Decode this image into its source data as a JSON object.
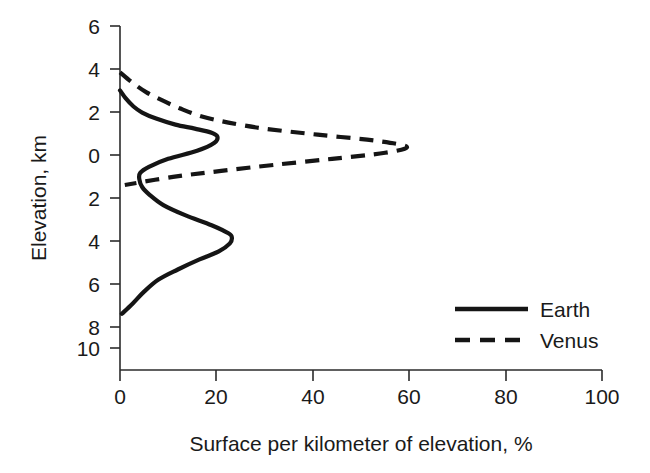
{
  "chart_data": {
    "type": "line",
    "title": "",
    "subtitle": "",
    "xlabel": "Surface per kilometer of elevation, %",
    "ylabel": "Elevation, km",
    "xlim": [
      0,
      100
    ],
    "ylim": [
      -10,
      6
    ],
    "grid": false,
    "orientation": "horizontal-distribution",
    "note": "y axis tick labels show magnitude only; values below 0 km are printed as positive numbers",
    "xticks": [
      0,
      20,
      40,
      60,
      80,
      100
    ],
    "xticklabels": [
      "0",
      "20",
      "40",
      "60",
      "80",
      "100"
    ],
    "yticks": [
      6,
      4,
      2,
      0,
      -2,
      -4,
      -6,
      -8,
      -10
    ],
    "yticklabels": [
      "6",
      "4",
      "2",
      "0",
      "2",
      "4",
      "6",
      "8",
      "10"
    ],
    "legend_position": "lower-right",
    "series": [
      {
        "name": "Earth",
        "style": "solid",
        "color": "#151515",
        "elevation_km": [
          2.8,
          2.4,
          2.0,
          1.7,
          1.4,
          1.1,
          0.9,
          0.7,
          0.5,
          0.2,
          -0.2,
          -0.6,
          -1.0,
          -1.3,
          -1.6,
          -2.0,
          -2.4,
          -2.9,
          -3.4,
          -3.9,
          -4.3,
          -4.5,
          -4.8,
          -5.2,
          -5.6,
          -6.1,
          -6.6,
          -7.2,
          -7.8,
          -8.3
        ],
        "surface_percent": [
          0.0,
          1.2,
          2.8,
          4.6,
          7.5,
          11.5,
          15.5,
          19.0,
          20.2,
          19.6,
          16.0,
          10.0,
          6.0,
          4.2,
          4.0,
          4.6,
          6.2,
          9.0,
          13.5,
          19.0,
          22.5,
          23.2,
          22.8,
          20.5,
          16.5,
          12.0,
          8.0,
          5.0,
          2.6,
          0.4
        ]
      },
      {
        "name": "Venus",
        "style": "dashed",
        "color": "#151515",
        "elevation_km": [
          3.7,
          3.2,
          2.7,
          2.3,
          1.9,
          1.5,
          1.2,
          0.9,
          0.6,
          0.3,
          0.0,
          -0.3,
          -0.6,
          -0.9,
          -1.2,
          -1.5,
          -1.9
        ],
        "surface_percent": [
          0.0,
          2.5,
          5.5,
          8.8,
          12.5,
          17.0,
          22.5,
          30.0,
          41.0,
          53.0,
          59.5,
          55.0,
          44.0,
          32.0,
          21.0,
          11.0,
          1.0
        ]
      }
    ],
    "legend": [
      {
        "label": "Earth",
        "style": "solid"
      },
      {
        "label": "Venus",
        "style": "dashed"
      }
    ]
  }
}
